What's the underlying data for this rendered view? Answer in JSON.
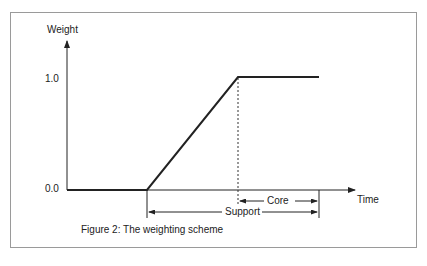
{
  "figure": {
    "caption": "Figure 2: The weighting scheme",
    "y_axis_label": "Weight",
    "x_axis_label": "Time",
    "y_ticks": [
      "1.0",
      "0.0"
    ],
    "spans": {
      "core_label": "Core",
      "support_label": "Support"
    },
    "colors": {
      "line": "#222222",
      "frame": "#9a9a9a"
    }
  }
}
